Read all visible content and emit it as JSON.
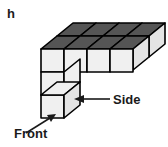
{
  "figure": {
    "part_label": "h",
    "type": "isometric-cube-structure",
    "annotations": [
      {
        "id": "side",
        "label": "Side",
        "arrow": "points-left-to-right-face-of-bottom-front-cube"
      },
      {
        "id": "front",
        "label": "Front",
        "arrow": "points-up-right-to-front-face-of-bottom-cube"
      }
    ],
    "colors": {
      "top_face": "#555555",
      "front_face": "#f0f0f0",
      "side_face": "#e4e4e4",
      "outline": "#000000",
      "text": "#1a1a1a",
      "background": "#ffffff"
    },
    "geometry": {
      "cube_width": 23,
      "cube_height": 23,
      "depth_dx": 16,
      "depth_dy": -13,
      "origin_x": 41,
      "origin_y": 85,
      "top_row_cubes": 4,
      "back_row_cubes": 4,
      "left_column_cubes_below": 2
    }
  }
}
